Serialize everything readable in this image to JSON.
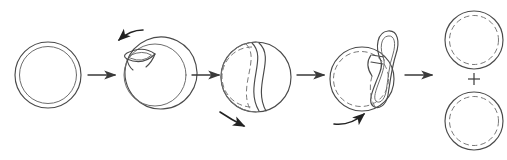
{
  "figure": {
    "type": "process-diagram",
    "background_color": "#ffffff",
    "stroke_color": "#4a4a4a",
    "inner_stroke_color": "#7a7a7a",
    "arrow_color": "#3a3a3a",
    "motion_arrow_color": "#222222",
    "stage_count": 5,
    "plus_symbol": "+"
  },
  "stages": [
    {
      "index": 1,
      "name": "intact-vesicle",
      "label": "",
      "description": "Intact spherical vesicle with double-layer membrane",
      "cx": 48,
      "cy": 75,
      "outer_r": 33,
      "inner_r": 28.5,
      "inner_style": "solid",
      "has_bud": false,
      "has_divider": false
    },
    {
      "index": 2,
      "name": "invagination-start",
      "label": "",
      "description": "Lens-shaped invagination forming at upper-left of membrane",
      "cx": 155,
      "cy": 75,
      "outer_r": 36,
      "inner_r": 31,
      "inner_style": "solid",
      "has_bud": true,
      "bud_shape": "lens",
      "has_divider": false
    },
    {
      "index": 3,
      "name": "septum-ingression",
      "label": "",
      "description": "S-shaped septum ingression partitioning the vesicle interior",
      "cx": 256,
      "cy": 77,
      "outer_r": 35,
      "inner_r": 30,
      "inner_style": "mixed",
      "has_bud": false,
      "has_divider": true,
      "divider_shape": "s-curve"
    },
    {
      "index": 4,
      "name": "budding-neck",
      "label": "",
      "description": "Daughter compartment extruded through a narrow neck at upper-right",
      "cx": 365,
      "cy": 77,
      "outer_r": 34,
      "inner_r": 29,
      "inner_style": "dashed",
      "has_bud": true,
      "bud_shape": "teardrop-loop",
      "has_divider": false
    },
    {
      "index": 5,
      "name": "separated-daughters",
      "label": "",
      "description": "Two separated daughter vesicles, each with dashed inner leaflet",
      "daughters": [
        {
          "name": "daughter-vesicle-top",
          "cx": 474,
          "cy": 40,
          "outer_r": 29,
          "inner_r": 24.5
        },
        {
          "name": "daughter-vesicle-bottom",
          "cx": 474,
          "cy": 121,
          "outer_r": 29,
          "inner_r": 24.5
        }
      ],
      "inner_style": "dashed",
      "has_bud": false,
      "has_divider": false
    }
  ],
  "flow_arrows": [
    {
      "name": "flow-arrow-1",
      "from_stage": 1,
      "to_stage": 2,
      "x1": 88,
      "x2": 116,
      "y": 75,
      "direction": "right"
    },
    {
      "name": "flow-arrow-2",
      "from_stage": 2,
      "to_stage": 3,
      "x1": 192,
      "x2": 220,
      "y": 75,
      "direction": "right"
    },
    {
      "name": "flow-arrow-3",
      "from_stage": 3,
      "to_stage": 4,
      "x1": 297,
      "x2": 325,
      "y": 75,
      "direction": "right"
    },
    {
      "name": "flow-arrow-4",
      "from_stage": 4,
      "to_stage": 5,
      "x1": 405,
      "x2": 433,
      "y": 75,
      "direction": "right"
    }
  ],
  "motion_arrows": [
    {
      "name": "motion-arrow-invagination",
      "stage": 2,
      "description": "Curved arrow pointing down-left toward the forming invagination",
      "direction": "down-left",
      "position": "above-left"
    },
    {
      "name": "motion-arrow-ingression",
      "stage": 3,
      "description": "Curved arrow pointing down-right below the constricting vesicle",
      "direction": "down-right",
      "position": "below-left"
    },
    {
      "name": "motion-arrow-scission",
      "stage": 4,
      "description": "Curved arrow pointing up-right below the budding vesicle",
      "direction": "up-right",
      "position": "below-left"
    }
  ]
}
